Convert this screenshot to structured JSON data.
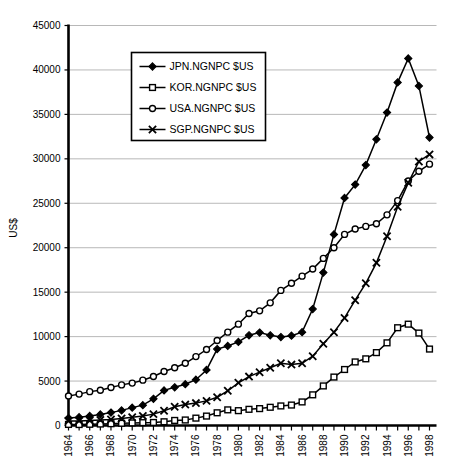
{
  "chart_data": {
    "type": "line",
    "title": "",
    "xlabel": "",
    "ylabel": "US$",
    "ylim": [
      0,
      45000
    ],
    "ytick_values": [
      0,
      5000,
      10000,
      15000,
      20000,
      25000,
      30000,
      35000,
      40000,
      45000
    ],
    "ytick_labels": [
      "0",
      "5000",
      "10000",
      "15000",
      "20000",
      "25000",
      "30000",
      "35000",
      "40000",
      "45000"
    ],
    "grid": true,
    "legend_position": "upper-left-inside",
    "x": [
      1964,
      1965,
      1966,
      1967,
      1968,
      1969,
      1970,
      1971,
      1972,
      1973,
      1974,
      1975,
      1976,
      1977,
      1978,
      1979,
      1980,
      1981,
      1982,
      1983,
      1984,
      1985,
      1986,
      1987,
      1988,
      1989,
      1990,
      1991,
      1992,
      1993,
      1994,
      1995,
      1996,
      1997,
      1998
    ],
    "xtick_labels": [
      "1964",
      "",
      "1966",
      "",
      "1968",
      "",
      "1970",
      "",
      "1972",
      "",
      "1974",
      "",
      "1976",
      "",
      "1978",
      "",
      "1980",
      "",
      "1982",
      "",
      "1984",
      "",
      "1986",
      "",
      "1988",
      "",
      "1990",
      "",
      "1992",
      "",
      "1994",
      "",
      "1996",
      "",
      "1998"
    ],
    "xlim": [
      1964,
      1998
    ],
    "series": [
      {
        "name": "JPN.NGNPC $US",
        "marker": "filled-diamond",
        "values": [
          840,
          940,
          1070,
          1250,
          1450,
          1700,
          2010,
          2290,
          3000,
          3950,
          4300,
          4650,
          5150,
          6250,
          8600,
          8950,
          9400,
          10150,
          10450,
          10150,
          9950,
          10100,
          10500,
          13100,
          17200,
          21500,
          25600,
          27100,
          29300,
          32200,
          35200,
          38600,
          41300,
          38200,
          32400
        ]
      },
      {
        "name": "KOR.NGNPC $US",
        "marker": "open-square",
        "values": [
          120,
          110,
          135,
          165,
          200,
          250,
          290,
          320,
          340,
          420,
          570,
          620,
          830,
          1060,
          1430,
          1760,
          1670,
          1820,
          1900,
          2050,
          2200,
          2300,
          2650,
          3450,
          4450,
          5450,
          6300,
          7150,
          7500,
          8200,
          9300,
          11000,
          11400,
          10400,
          8600
        ]
      },
      {
        "name": "USA.NGNPC $US",
        "marker": "open-circle",
        "values": [
          3320,
          3530,
          3810,
          3970,
          4280,
          4570,
          4770,
          5100,
          5520,
          6080,
          6500,
          7000,
          7750,
          8550,
          9560,
          10500,
          11400,
          12600,
          12900,
          13800,
          15200,
          16000,
          16800,
          17600,
          18800,
          20000,
          21500,
          22100,
          22400,
          22700,
          23700,
          25300,
          27500,
          28600,
          29400
        ]
      },
      {
        "name": "SGP.NGNPC $US",
        "marker": "x",
        "values": [
          500,
          520,
          560,
          620,
          680,
          780,
          920,
          1080,
          1280,
          1650,
          2100,
          2350,
          2520,
          2770,
          3180,
          3900,
          4800,
          5500,
          6000,
          6500,
          7000,
          6850,
          7000,
          7800,
          9200,
          10500,
          12100,
          14100,
          16000,
          18300,
          21300,
          24600,
          27300,
          29700,
          30500
        ]
      }
    ]
  },
  "legend": {
    "entries": [
      {
        "label": "JPN.NGNPC $US",
        "marker": "filled-diamond"
      },
      {
        "label": "KOR.NGNPC $US",
        "marker": "open-square"
      },
      {
        "label": "USA.NGNPC $US",
        "marker": "open-circle"
      },
      {
        "label": "SGP.NGNPC $US",
        "marker": "x"
      }
    ]
  },
  "axes": {
    "y_title": "US$"
  }
}
